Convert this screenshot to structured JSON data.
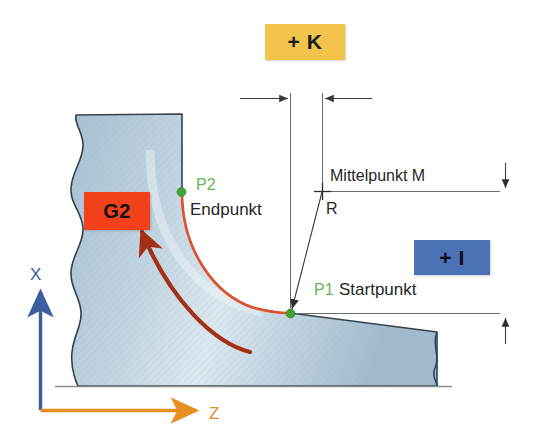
{
  "diagram": {
    "language": "de"
  },
  "badges": {
    "k": {
      "label": "+ K",
      "color": "#F3C44B",
      "meaning": "K-Parameter (Z-Richtung zum Mittelpunkt)"
    },
    "i": {
      "label": "+ I",
      "color": "#4A72B4",
      "meaning": "I-Parameter (X-Richtung zum Mittelpunkt)"
    },
    "g2": {
      "label": "G2",
      "color": "#F2411A",
      "meaning": "Kreisbogen im Uhrzeigersinn"
    }
  },
  "points": {
    "p2": {
      "tag": "P2",
      "name": "Endpunkt",
      "marker_color": "#3FA535"
    },
    "p1": {
      "tag": "P1",
      "name": "Startpunkt",
      "marker_color": "#3FA535"
    },
    "center": {
      "label": "Mittelpunkt M",
      "radius_label": "R"
    }
  },
  "axes": {
    "x": {
      "label": "X",
      "color": "#3A5E9E"
    },
    "z": {
      "label": "Z",
      "color": "#E3901F"
    }
  },
  "geometry": {
    "workpiece_fill": "#B9CEDD",
    "arc_color": "#E2512A",
    "feed_arrow_color": "#A33116",
    "dimension_line_color": "#555555",
    "outline_color": "#33404A"
  }
}
